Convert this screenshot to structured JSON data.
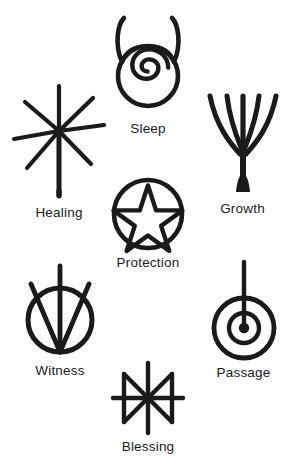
{
  "page": {
    "background_color": "#ffffff",
    "ink_color": "#1a1a1a",
    "width": 295,
    "height": 474
  },
  "symbols": [
    {
      "id": "healing",
      "label": "Healing",
      "icon": "eight-ray-star-with-staff-icon",
      "description": "Eight-rayed asterisk star with an elongated lower ray forming a staff"
    },
    {
      "id": "sleep",
      "label": "Sleep",
      "icon": "horned-circle-spiral-icon",
      "description": "Circle topped with crescent horns enclosing an inward spiral"
    },
    {
      "id": "growth",
      "label": "Growth",
      "icon": "branching-tree-icon",
      "description": "Five branches rising from a single flared trunk"
    },
    {
      "id": "protection",
      "label": "Protection",
      "icon": "pentacle-icon",
      "description": "Upright five-pointed star enclosed in a circle"
    },
    {
      "id": "witness",
      "label": "Witness",
      "icon": "circle-three-converging-lines-icon",
      "description": "Circle crossed by three lines converging at its base"
    },
    {
      "id": "passage",
      "label": "Passage",
      "icon": "concentric-circles-with-line-icon",
      "description": "Concentric rings with a filled centre pierced by a vertical line"
    },
    {
      "id": "blessing",
      "label": "Blessing",
      "icon": "eight-ray-rune-icon",
      "description": "Eight-rayed star bounded by vertical bars on each side"
    }
  ]
}
